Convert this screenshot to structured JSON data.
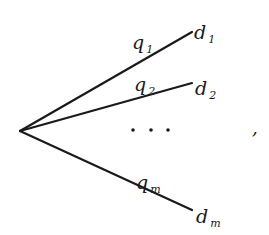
{
  "diagram": {
    "type": "tree-fan",
    "root": {
      "x": 20,
      "y": 131
    },
    "edges": [
      {
        "id": "1",
        "edge_label": "q",
        "edge_sub": "1",
        "node_label": "d",
        "node_sub": "1",
        "end": {
          "x": 192,
          "y": 32
        },
        "q_pos": {
          "x": 134,
          "y": 49
        },
        "d_pos": {
          "x": 195,
          "y": 39
        }
      },
      {
        "id": "2",
        "edge_label": "q",
        "edge_sub": "2",
        "node_label": "d",
        "node_sub": "2",
        "end": {
          "x": 192,
          "y": 83
        },
        "q_pos": {
          "x": 136,
          "y": 91
        },
        "d_pos": {
          "x": 196,
          "y": 95
        }
      },
      {
        "id": "m",
        "edge_label": "q",
        "edge_sub": "m",
        "node_label": "d",
        "node_sub": "m",
        "end": {
          "x": 192,
          "y": 210
        },
        "q_pos": {
          "x": 138,
          "y": 189
        },
        "d_pos": {
          "x": 197,
          "y": 223
        }
      }
    ],
    "ellipsis": "· · ·",
    "trailing_punctuation": ",",
    "colors": {
      "ink": "#1a1a1a",
      "background": "#ffffff"
    }
  }
}
